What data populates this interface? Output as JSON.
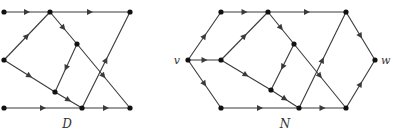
{
  "diagrams": [
    {
      "id": "D",
      "label": "D",
      "label_pos": [
        67,
        128
      ],
      "nodes": [
        {
          "id": "d1",
          "x": 4,
          "y": 12
        },
        {
          "id": "d2",
          "x": 50,
          "y": 12
        },
        {
          "id": "d3",
          "x": 130,
          "y": 12
        },
        {
          "id": "d4",
          "x": 4,
          "y": 60
        },
        {
          "id": "d5",
          "x": 77,
          "y": 44
        },
        {
          "id": "d6",
          "x": 55,
          "y": 92
        },
        {
          "id": "d7",
          "x": 4,
          "y": 108
        },
        {
          "id": "d8",
          "x": 82,
          "y": 108
        },
        {
          "id": "d9",
          "x": 130,
          "y": 108
        }
      ],
      "edges": [
        [
          "d1",
          "d2"
        ],
        [
          "d2",
          "d3"
        ],
        [
          "d4",
          "d2"
        ],
        [
          "d2",
          "d5"
        ],
        [
          "d5",
          "d6"
        ],
        [
          "d5",
          "d9"
        ],
        [
          "d4",
          "d6"
        ],
        [
          "d6",
          "d8"
        ],
        [
          "d7",
          "d8"
        ],
        [
          "d8",
          "d9"
        ],
        [
          "d8",
          "d3"
        ]
      ]
    },
    {
      "id": "N",
      "label": "N",
      "label_pos": [
        285,
        128
      ],
      "nodes": [
        {
          "id": "v",
          "x": 188,
          "y": 60,
          "label": "v",
          "label_dx": -8,
          "label_dy": 4
        },
        {
          "id": "n1",
          "x": 221,
          "y": 12
        },
        {
          "id": "n2",
          "x": 268,
          "y": 12
        },
        {
          "id": "n3",
          "x": 346,
          "y": 12
        },
        {
          "id": "n4",
          "x": 221,
          "y": 60
        },
        {
          "id": "n5",
          "x": 294,
          "y": 44
        },
        {
          "id": "n6",
          "x": 271,
          "y": 90
        },
        {
          "id": "n7",
          "x": 221,
          "y": 108
        },
        {
          "id": "n8",
          "x": 299,
          "y": 108
        },
        {
          "id": "n9",
          "x": 346,
          "y": 108
        },
        {
          "id": "w",
          "x": 375,
          "y": 60,
          "label": "w",
          "label_dx": 6,
          "label_dy": 4
        }
      ],
      "edges": [
        [
          "v",
          "n1"
        ],
        [
          "v",
          "n4"
        ],
        [
          "v",
          "n7"
        ],
        [
          "n1",
          "n2"
        ],
        [
          "n2",
          "n3"
        ],
        [
          "n4",
          "n2"
        ],
        [
          "n2",
          "n5"
        ],
        [
          "n5",
          "n6"
        ],
        [
          "n5",
          "n9"
        ],
        [
          "n4",
          "n6"
        ],
        [
          "n6",
          "n8"
        ],
        [
          "n7",
          "n8"
        ],
        [
          "n8",
          "n9"
        ],
        [
          "n8",
          "n3"
        ],
        [
          "n3",
          "w"
        ],
        [
          "n9",
          "w"
        ]
      ]
    }
  ],
  "style": {
    "edge_color": "#3a3a3a",
    "node_color": "#111111",
    "node_radius": 2.6
  }
}
